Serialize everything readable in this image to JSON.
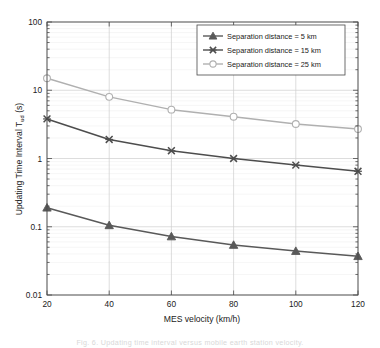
{
  "figure": {
    "caption": "Fig. 6.   Updating time interval versus mobile earth station velocity."
  },
  "chart_data": {
    "type": "line",
    "title": "",
    "xlabel": "MES velocity (km/h)",
    "ylabel": "Updating Time Interval  T",
    "ylabel_sub": "ud",
    "ylabel_unit": " (s)",
    "x": [
      20,
      40,
      60,
      80,
      100,
      120
    ],
    "xlim": [
      20,
      120
    ],
    "ylim": [
      0.01,
      100
    ],
    "yscale": "log",
    "xscale": "linear",
    "xticks": [
      "20",
      "40",
      "60",
      "80",
      "100",
      "120"
    ],
    "yticks": [
      "0.01",
      "0.1",
      "1",
      "10",
      "100"
    ],
    "grid": true,
    "legend_position": "upper right",
    "series": [
      {
        "name": "Separation distance = 5 km",
        "marker": "triangle",
        "color": "#595959",
        "values": [
          0.19,
          0.105,
          0.072,
          0.054,
          0.044,
          0.037
        ]
      },
      {
        "name": "Separation distance = 15 km",
        "marker": "x-cross",
        "color": "#4d4d4d",
        "values": [
          3.8,
          1.9,
          1.3,
          1.0,
          0.8,
          0.65
        ]
      },
      {
        "name": "Separation distance = 25 km",
        "marker": "circle",
        "color": "#b0b0b0",
        "values": [
          15.0,
          8.0,
          5.2,
          4.1,
          3.2,
          2.7
        ]
      }
    ]
  },
  "colors": {
    "axis": "#4a4a4a",
    "grid": "#dcdcdc",
    "background": "#ffffff"
  }
}
